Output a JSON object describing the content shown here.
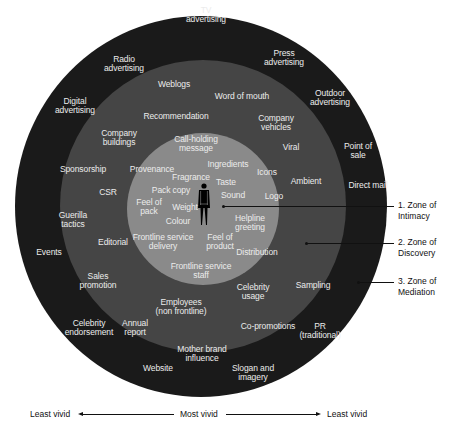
{
  "diagram": {
    "type": "concentric-zones",
    "colors": {
      "outer": "#1a1a1a",
      "middle": "#454545",
      "inner": "#8a8a8a",
      "text": "#ececec"
    },
    "center_icon": "person-icon",
    "zones": [
      {
        "id": "intimacy",
        "label": "1. Zone of\nIntimacy"
      },
      {
        "id": "discovery",
        "label": "2. Zone of\nDiscovery"
      },
      {
        "id": "mediation",
        "label": "3. Zone of\nMediation"
      }
    ],
    "inner_items": [
      {
        "label": "Call-holding\nmessage",
        "x": 196,
        "y": 143
      },
      {
        "label": "Provenance",
        "x": 152,
        "y": 169
      },
      {
        "label": "Ingredients",
        "x": 228,
        "y": 164
      },
      {
        "label": "Fragrance",
        "x": 191,
        "y": 177
      },
      {
        "label": "Taste",
        "x": 226,
        "y": 182
      },
      {
        "label": "Pack copy",
        "x": 171,
        "y": 190
      },
      {
        "label": "Sound",
        "x": 233,
        "y": 195
      },
      {
        "label": "Feel of\npack",
        "x": 149,
        "y": 206
      },
      {
        "label": "Weight",
        "x": 185,
        "y": 207
      },
      {
        "label": "Colour",
        "x": 178,
        "y": 221
      },
      {
        "label": "Helpline\ngreeting",
        "x": 250,
        "y": 222
      },
      {
        "label": "Frontline service\ndelivery",
        "x": 163,
        "y": 241
      },
      {
        "label": "Feel of\nproduct",
        "x": 220,
        "y": 241
      },
      {
        "label": "Distribution",
        "x": 257,
        "y": 252
      },
      {
        "label": "Frontline service\nstaff",
        "x": 201,
        "y": 270
      }
    ],
    "middle_items": [
      {
        "label": "Weblogs",
        "x": 174,
        "y": 84
      },
      {
        "label": "Word of mouth",
        "x": 242,
        "y": 96
      },
      {
        "label": "Recommendation",
        "x": 176,
        "y": 116
      },
      {
        "label": "Company\nbuildings",
        "x": 119,
        "y": 137
      },
      {
        "label": "Company\nvehicles",
        "x": 276,
        "y": 122
      },
      {
        "label": "Viral",
        "x": 291,
        "y": 147
      },
      {
        "label": "Icons",
        "x": 267,
        "y": 172
      },
      {
        "label": "Ambient",
        "x": 306,
        "y": 181
      },
      {
        "label": "Logo",
        "x": 274,
        "y": 196
      },
      {
        "label": "CSR",
        "x": 108,
        "y": 192
      },
      {
        "label": "Guerilla\ntactics",
        "x": 73,
        "y": 219
      },
      {
        "label": "Editorial",
        "x": 113,
        "y": 242
      },
      {
        "label": "Sales\npromotion",
        "x": 98,
        "y": 280
      },
      {
        "label": "Celebrity\nusage",
        "x": 253,
        "y": 291
      },
      {
        "label": "Sampling",
        "x": 313,
        "y": 285
      },
      {
        "label": "Employees\n(non frontline)",
        "x": 181,
        "y": 306
      },
      {
        "label": "Annual\nreport",
        "x": 135,
        "y": 327
      },
      {
        "label": "Co-promotions",
        "x": 268,
        "y": 326
      },
      {
        "label": "Mother brand\ninfluence",
        "x": 202,
        "y": 353
      }
    ],
    "outer_items": [
      {
        "label": "TV\nadvertising",
        "x": 206,
        "y": 14
      },
      {
        "label": "Radio\nadvertising",
        "x": 124,
        "y": 63
      },
      {
        "label": "Press\nadvertising",
        "x": 284,
        "y": 57
      },
      {
        "label": "Digital\nadvertising",
        "x": 75,
        "y": 105
      },
      {
        "label": "Outdoor\nadvertising",
        "x": 330,
        "y": 97
      },
      {
        "label": "Point of\nsale",
        "x": 358,
        "y": 150
      },
      {
        "label": "Sponsorship",
        "x": 83,
        "y": 169
      },
      {
        "label": "Direct mail",
        "x": 368,
        "y": 185
      },
      {
        "label": "Events",
        "x": 49,
        "y": 252
      },
      {
        "label": "Celebrity\nendorsement",
        "x": 89,
        "y": 327
      },
      {
        "label": "PR\n(traditional)",
        "x": 320,
        "y": 330
      },
      {
        "label": "Website",
        "x": 158,
        "y": 368
      },
      {
        "label": "Slogan and\nimagery",
        "x": 253,
        "y": 372
      }
    ]
  },
  "axis": {
    "left_label": "Least vivid",
    "center_label": "Most vivid",
    "right_label": "Least vivid"
  }
}
